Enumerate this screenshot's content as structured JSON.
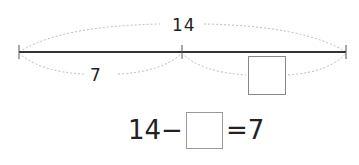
{
  "top_text_partial": "",
  "diagram": {
    "total_label": "14",
    "known_part_label": "7",
    "unknown_part": "blank-box",
    "line_color": "#333333",
    "brace_color": "#bbbbbb"
  },
  "equation": {
    "left_operand": "14",
    "operator": "−",
    "blank": "",
    "equals": "=",
    "result": "7"
  }
}
